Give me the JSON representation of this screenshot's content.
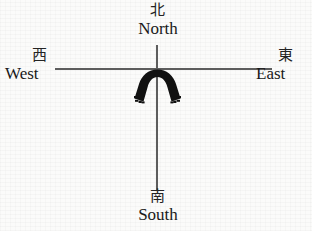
{
  "figure": {
    "type": "compass-orientation-diagram",
    "background_color": "#fbfbfa",
    "line_color": "#5d5d5d",
    "figure_color": "#111111"
  },
  "directions": {
    "north": {
      "cjk": "北",
      "roman": "North"
    },
    "south": {
      "cjk": "南",
      "roman": "South"
    },
    "west": {
      "cjk": "西",
      "roman": "West"
    },
    "east": {
      "cjk": "東",
      "roman": "East"
    }
  },
  "center_figure": {
    "name": "horseshoe-arch-shape",
    "description": "Solid black downward-opening U-shaped arch straddling the vertical axis just below the crossing point"
  }
}
